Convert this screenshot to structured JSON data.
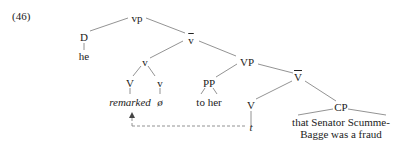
{
  "example_number": "(46)",
  "nodes": {
    "vp": "vp",
    "D": "D",
    "he": "he",
    "vbar": "v",
    "v": "v",
    "VP": "VP",
    "V": "V",
    "v_small": "v",
    "remarked": "remarked",
    "null": "ø",
    "PP": "PP",
    "to_her": "to her",
    "Vbar": "V",
    "V2": "V",
    "t": "t",
    "CP": "CP",
    "cp_text_1": "that Senator Scumme-",
    "cp_text_2": "Bagge was a fraud"
  },
  "colors": {
    "line": "#666666",
    "text": "#222222"
  }
}
